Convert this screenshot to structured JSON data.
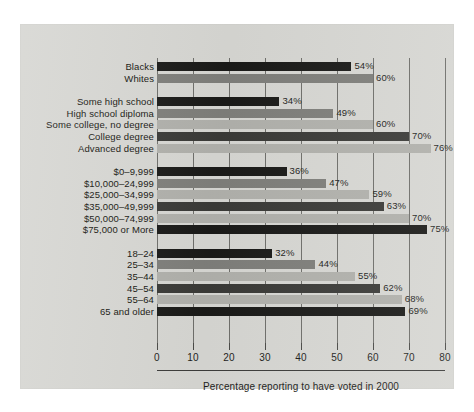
{
  "figure": {
    "caption": "Percentage reporting to have voted in 2000",
    "panel_color": "#d6d6d2",
    "bar_colors": {
      "dark": "#1a1a18",
      "mid": "#7e7e7a",
      "light": "#b0b0ab",
      "darkalt": "#3a3a37"
    }
  },
  "chart_data": {
    "type": "bar",
    "orientation": "horizontal",
    "title": "",
    "subtitle": "",
    "xlabel": "Percentage reporting to have voted in 2000",
    "ylabel": "",
    "xlim": [
      0,
      80
    ],
    "xticks": [
      0,
      10,
      20,
      30,
      40,
      50,
      60,
      70,
      80
    ],
    "xticklabels": [
      "0",
      "10",
      "20",
      "30",
      "40",
      "50",
      "60",
      "70",
      "80"
    ],
    "grid": true,
    "grid_axis": "x",
    "legend": false,
    "legend_position": "none",
    "value_label_suffix": "%",
    "groups": [
      {
        "name": "Race",
        "items": [
          {
            "label": "Blacks",
            "value": 54,
            "value_label": "54%",
            "shade": "dark"
          },
          {
            "label": "Whites",
            "value": 60,
            "value_label": "60%",
            "shade": "mid"
          }
        ]
      },
      {
        "name": "Education",
        "items": [
          {
            "label": "Some high school",
            "value": 34,
            "value_label": "34%",
            "shade": "dark"
          },
          {
            "label": "High school diploma",
            "value": 49,
            "value_label": "49%",
            "shade": "mid"
          },
          {
            "label": "Some college, no degree",
            "value": 60,
            "value_label": "60%",
            "shade": "light"
          },
          {
            "label": "College degree",
            "value": 70,
            "value_label": "70%",
            "shade": "darkalt"
          },
          {
            "label": "Advanced degree",
            "value": 76,
            "value_label": "76%",
            "shade": "light"
          }
        ]
      },
      {
        "name": "Income",
        "items": [
          {
            "label": "$0–9,999",
            "value": 36,
            "value_label": "36%",
            "shade": "dark"
          },
          {
            "label": "$10,000–24,999",
            "value": 47,
            "value_label": "47%",
            "shade": "mid"
          },
          {
            "label": "$25,000–34,999",
            "value": 59,
            "value_label": "59%",
            "shade": "light"
          },
          {
            "label": "$35,000–49,999",
            "value": 63,
            "value_label": "63%",
            "shade": "darkalt"
          },
          {
            "label": "$50,000–74,999",
            "value": 70,
            "value_label": "70%",
            "shade": "light"
          },
          {
            "label": "$75,000 or More",
            "value": 75,
            "value_label": "75%",
            "shade": "dark"
          }
        ]
      },
      {
        "name": "Age",
        "items": [
          {
            "label": "18–24",
            "value": 32,
            "value_label": "32%",
            "shade": "dark"
          },
          {
            "label": "25–34",
            "value": 44,
            "value_label": "44%",
            "shade": "mid"
          },
          {
            "label": "35–44",
            "value": 55,
            "value_label": "55%",
            "shade": "light"
          },
          {
            "label": "45–54",
            "value": 62,
            "value_label": "62%",
            "shade": "darkalt"
          },
          {
            "label": "55–64",
            "value": 68,
            "value_label": "68%",
            "shade": "light"
          },
          {
            "label": "65 and older",
            "value": 69,
            "value_label": "69%",
            "shade": "dark"
          }
        ]
      }
    ]
  }
}
